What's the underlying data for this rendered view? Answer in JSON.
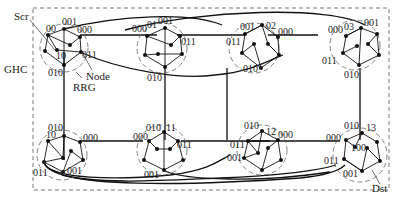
{
  "diagram": {
    "outer_label": "GHC",
    "annotations": {
      "src": "Scr",
      "node": "Node",
      "rrg": "RRG",
      "dst": "Dst"
    },
    "clusters": [
      {
        "id": "00",
        "labels": {
          "top": "001",
          "left": "00",
          "right": "000",
          "mid": "10",
          "right2": "011",
          "bottom": "010"
        }
      },
      {
        "id": "01",
        "labels": {
          "top": "001",
          "left": "000",
          "id": "01",
          "right": "011",
          "bottom": "010"
        }
      },
      {
        "id": "02",
        "labels": {
          "top": "001",
          "id": "02",
          "right": "000",
          "left": "011",
          "bottom": "010"
        }
      },
      {
        "id": "03",
        "labels": {
          "top": "001",
          "id": "03",
          "left": "000",
          "right": "011",
          "bottom": "010"
        }
      },
      {
        "id": "10",
        "labels": {
          "top": "010",
          "id": "10",
          "right": "000",
          "left": "011",
          "bottom": "001"
        }
      },
      {
        "id": "11",
        "labels": {
          "top": "010",
          "id": "11",
          "left": "000",
          "right": "011",
          "bottom": "001"
        }
      },
      {
        "id": "12",
        "labels": {
          "top": "010",
          "id": "12",
          "right": "000",
          "left": "011",
          "left2": "001"
        }
      },
      {
        "id": "13",
        "labels": {
          "top": "010",
          "id": "13",
          "left": "000",
          "mid": "100",
          "left2": "011",
          "bottom": "001"
        }
      }
    ],
    "colors": {
      "line": "#111111",
      "dash": "#555555",
      "background": "#ffffff"
    }
  }
}
